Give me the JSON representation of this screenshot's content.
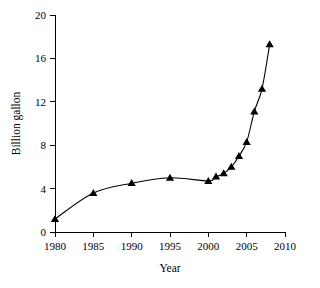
{
  "chart_data": {
    "type": "line",
    "title": "",
    "xlabel": "Year",
    "ylabel": "Billion gallon",
    "xlim": [
      1980,
      2010
    ],
    "ylim": [
      0,
      20
    ],
    "grid": false,
    "legend": null,
    "marker": "triangle",
    "line_color": "#000000",
    "marker_color": "#000000",
    "xticks": [
      1980,
      1985,
      1990,
      1995,
      2000,
      2005,
      2010
    ],
    "xtick_labels": [
      "1980",
      "1985",
      "1990",
      "1995",
      "2000",
      "2005",
      "2010"
    ],
    "yticks": [
      0,
      4,
      8,
      12,
      16,
      20
    ],
    "ytick_labels": [
      "0",
      "4",
      "8",
      "12",
      "16",
      "20"
    ],
    "x": [
      1980,
      1985,
      1990,
      1995,
      2000,
      2001,
      2002,
      2003,
      2004,
      2005,
      2006,
      2007,
      2008
    ],
    "values": [
      1.2,
      3.6,
      4.5,
      5.0,
      4.7,
      5.1,
      5.4,
      6.0,
      7.0,
      8.3,
      11.1,
      13.2,
      17.3
    ],
    "series": [
      {
        "name": "Billion gallon",
        "values": [
          1.2,
          3.6,
          4.5,
          5.0,
          4.7,
          5.1,
          5.4,
          6.0,
          7.0,
          8.3,
          11.1,
          13.2,
          17.3
        ]
      }
    ]
  }
}
